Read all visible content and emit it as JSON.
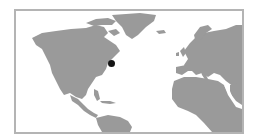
{
  "map": {
    "type": "world-map-thumbnail",
    "region": "North Atlantic",
    "land_color": "#9a9a9a",
    "water_color": "#ffffff",
    "border_color": "#b4b4b4",
    "marker": {
      "color": "#141414",
      "x": 108,
      "y": 59,
      "approx_location": "US East Coast (New England)"
    },
    "visible_regions": [
      "North America",
      "Greenland",
      "Europe",
      "Africa",
      "South America",
      "Caribbean"
    ]
  }
}
